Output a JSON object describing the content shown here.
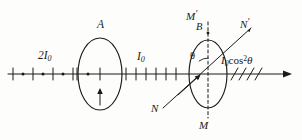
{
  "figure": {
    "type": "optics-ray-diagram",
    "background_color": "#fdfdfc",
    "stroke_color": "#1a1a1a",
    "labels": {
      "incident_intensity": "2I",
      "incident_intensity_sub": "0",
      "polarizer": "A",
      "after_polarizer_intensity": "I",
      "after_polarizer_intensity_sub": "0",
      "analyzer_axis_top": "M",
      "analyzer_axis_top_prime": "′",
      "analyzer_axis_bottom": "M",
      "transmission_axis_top": "N",
      "transmission_axis_top_prime": "′",
      "transmission_axis_bottom": "N",
      "analyzer_point": "B",
      "angle": "θ",
      "output_intensity_head": "I",
      "output_intensity_sub": "0",
      "output_intensity_cos": "cos",
      "output_intensity_exp": "2",
      "output_intensity_theta": "θ"
    },
    "geometry": {
      "axis_y": 74,
      "axis_x_start": 8,
      "axis_x_end": 292,
      "polarizer_center_x": 100,
      "polarizer_rx": 22,
      "polarizer_ry": 36,
      "analyzer_center_x": 208,
      "analyzer_rx": 19,
      "analyzer_ry": 34,
      "angle_degrees": 35
    },
    "annotations": {
      "unpolarized_marks": "dots-and-ticks",
      "plane_polarized_marks": "ticks-only",
      "output_marks": "diagonal-slashes"
    }
  }
}
